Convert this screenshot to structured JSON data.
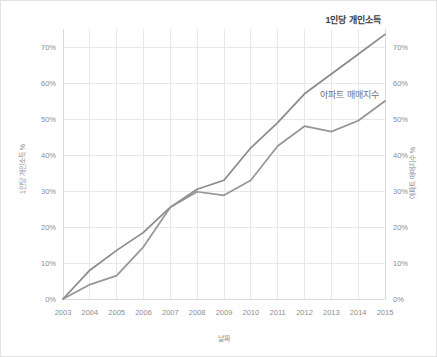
{
  "chart_data": {
    "type": "line",
    "title": "",
    "xlabel": "날짜",
    "ylabel": "1인당 개인소득 %",
    "ylabel_right": "아파트 매매지수 %",
    "x": [
      2003,
      2004,
      2005,
      2006,
      2007,
      2008,
      2009,
      2010,
      2011,
      2012,
      2013,
      2014,
      2015
    ],
    "categories": [
      "2003",
      "2004",
      "2005",
      "2006",
      "2007",
      "2008",
      "2009",
      "2010",
      "2011",
      "2012",
      "2013",
      "2014",
      "2015"
    ],
    "ylim": [
      0,
      75
    ],
    "ylim_right": [
      0,
      75
    ],
    "yticks": [
      0,
      10,
      20,
      30,
      40,
      50,
      60,
      70
    ],
    "ytick_labels": [
      "0%",
      "10%",
      "20%",
      "30%",
      "40%",
      "50%",
      "60%",
      "70%"
    ],
    "ytick_labels_right": [
      "0%",
      "10%",
      "20%",
      "30%",
      "40%",
      "50%",
      "60%",
      "70%"
    ],
    "grid": true,
    "legend": "inline-labels",
    "series": [
      {
        "name": "1인당 개인소득",
        "axis": "left",
        "color": "#8a8a8e",
        "emphasis": "bold",
        "values": [
          0,
          8.0,
          13.5,
          18.5,
          25.5,
          30.5,
          33.0,
          42.0,
          49.0,
          57.0,
          62.5,
          68.0,
          73.5
        ]
      },
      {
        "name": "아파트 매매지수",
        "axis": "right",
        "color": "#95959a",
        "emphasis": "normal",
        "values": [
          0,
          4.0,
          6.5,
          14.5,
          25.5,
          29.8,
          28.8,
          33.0,
          42.5,
          48.0,
          46.5,
          49.5,
          55.0
        ]
      }
    ],
    "annotations": [
      {
        "text": "1인당 개인소득",
        "series": 0
      },
      {
        "text": "아파트 매매지수",
        "series": 1
      }
    ]
  },
  "colors": {
    "series_income": "#8a8a8e",
    "series_apartment": "#95959a",
    "grid": "#e8e8ea",
    "axis_text": "#8d8d91",
    "label_income": "#3b3b3d",
    "label_apartment": "#6f6f74",
    "background": "#ffffff",
    "border": "#e2e2e2"
  }
}
